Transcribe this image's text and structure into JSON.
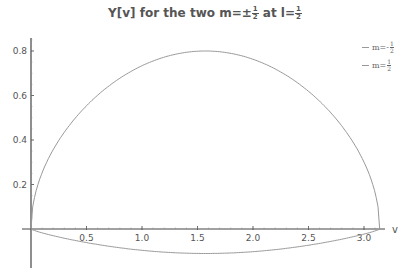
{
  "chart_data": {
    "type": "line",
    "title_parts": {
      "prefix": "Y[v] for the two m=±",
      "m_num": "1",
      "m_den": "2",
      "middle": " at l=",
      "l_num": "1",
      "l_den": "2"
    },
    "xlabel": "v",
    "ylabel": "",
    "xlim": [
      0,
      3.2
    ],
    "ylim": [
      -0.17,
      0.85
    ],
    "x_ticks": [
      "0.5",
      "1.0",
      "1.5",
      "2.0",
      "2.5",
      "3.0"
    ],
    "y_ticks": [
      "0.2",
      "0.4",
      "0.6",
      "0.8"
    ],
    "grid": false,
    "legend_position": "top-right",
    "series": [
      {
        "name": "m=-1/2",
        "label_prefix": "m=-",
        "label_num": "1",
        "label_den": "2",
        "description": "upper arc from (0,0) peaking ~0.80 at v≈π/2 returning to 0 at v≈π",
        "x": [
          0,
          0.1,
          0.3,
          0.5,
          0.8,
          1.0,
          1.2,
          1.5708,
          1.9,
          2.2,
          2.5,
          2.8,
          3.0,
          3.1,
          3.1416
        ],
        "values": [
          0,
          0.25,
          0.42,
          0.54,
          0.66,
          0.72,
          0.76,
          0.8,
          0.77,
          0.71,
          0.6,
          0.42,
          0.27,
          0.15,
          0
        ]
      },
      {
        "name": "m=1/2",
        "label_prefix": "m=",
        "label_num": "1",
        "label_den": "2",
        "description": "shallow lower arc from (0,0) with min ~-0.11 at v≈π/2 returning to 0 at v≈π",
        "x": [
          0,
          0.3,
          0.6,
          1.0,
          1.5708,
          2.0,
          2.5,
          2.8,
          3.0,
          3.1416
        ],
        "values": [
          0,
          -0.04,
          -0.07,
          -0.1,
          -0.11,
          -0.105,
          -0.085,
          -0.06,
          -0.035,
          0
        ]
      }
    ]
  },
  "colors": {
    "curve": "#999999",
    "axis": "#444444",
    "text": "#555555"
  }
}
